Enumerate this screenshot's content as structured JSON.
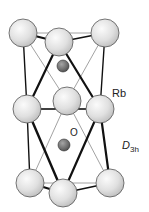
{
  "figure": {
    "labels": {
      "rb": "Rb",
      "o": "O",
      "symmetry_main": "D",
      "symmetry_sub": "3h"
    },
    "colors": {
      "background": "#ffffff",
      "rb_fill": "#e2e2e2",
      "rb_highlight": "#f7f7f7",
      "rb_stroke": "#555555",
      "o_fill": "#6f6f6f",
      "o_highlight": "#9a9a9a",
      "bond": "#111111",
      "thin_bond": "#8a8a8a"
    },
    "atoms": {
      "rb": [
        {
          "id": "rb-top-left",
          "cx": 23,
          "cy": 33,
          "r": 14
        },
        {
          "id": "rb-top-right",
          "cx": 105,
          "cy": 33,
          "r": 14
        },
        {
          "id": "rb-top-front",
          "cx": 59,
          "cy": 42,
          "r": 14
        },
        {
          "id": "rb-mid-back",
          "cx": 67,
          "cy": 101,
          "r": 14
        },
        {
          "id": "rb-mid-left",
          "cx": 27,
          "cy": 109,
          "r": 14
        },
        {
          "id": "rb-mid-right",
          "cx": 100,
          "cy": 109,
          "r": 14
        },
        {
          "id": "rb-bot-left",
          "cx": 30,
          "cy": 183,
          "r": 14
        },
        {
          "id": "rb-bot-right",
          "cx": 110,
          "cy": 183,
          "r": 14
        },
        {
          "id": "rb-bot-front",
          "cx": 63,
          "cy": 193,
          "r": 14
        }
      ],
      "o": [
        {
          "id": "o-upper",
          "cx": 63,
          "cy": 66,
          "r": 6
        },
        {
          "id": "o-lower",
          "cx": 64,
          "cy": 145,
          "r": 6
        }
      ]
    }
  }
}
